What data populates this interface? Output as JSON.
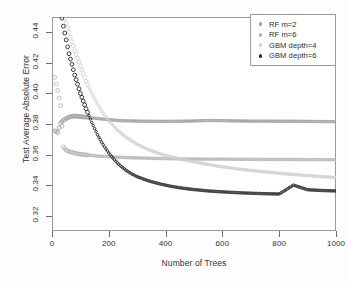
{
  "chart_data": {
    "type": "scatter",
    "title": "",
    "xlabel": "Number of Trees",
    "ylabel": "Test Average Absolute Error",
    "xlim": [
      0,
      1000
    ],
    "ylim": [
      0.31,
      0.45
    ],
    "xticks": [
      "0",
      "200",
      "400",
      "600",
      "800",
      "1000"
    ],
    "xtick_values": [
      0,
      200,
      400,
      600,
      800,
      1000
    ],
    "yticks": [
      "0.32",
      "0.34",
      "0.36",
      "0.38",
      "0.40",
      "0.42",
      "0.44"
    ],
    "ytick_values": [
      0.32,
      0.34,
      0.36,
      0.38,
      0.4,
      0.42,
      0.44
    ],
    "grid": false,
    "legend_position": "top-right",
    "marker": "open-circle",
    "series": [
      {
        "name": "RF m=2",
        "color": "#9e9e9e",
        "x": [
          10,
          20,
          30,
          40,
          50,
          60,
          70,
          80,
          90,
          100,
          120,
          140,
          160,
          180,
          200,
          240,
          280,
          320,
          360,
          400,
          450,
          500,
          550,
          600,
          650,
          700,
          750,
          800,
          850,
          900,
          950,
          1000
        ],
        "y": [
          0.3755,
          0.3745,
          0.3805,
          0.3825,
          0.3835,
          0.3845,
          0.385,
          0.3852,
          0.385,
          0.3848,
          0.3845,
          0.384,
          0.3836,
          0.3832,
          0.3828,
          0.3822,
          0.382,
          0.3818,
          0.3818,
          0.3817,
          0.3818,
          0.382,
          0.3823,
          0.3822,
          0.382,
          0.3819,
          0.3819,
          0.3818,
          0.3818,
          0.3817,
          0.3816,
          0.3815
        ]
      },
      {
        "name": "RF m=6",
        "color": "#b5b5b5",
        "x": [
          10,
          20,
          30,
          40,
          50,
          60,
          70,
          80,
          90,
          100,
          120,
          140,
          160,
          180,
          200,
          240,
          280,
          320,
          360,
          400,
          450,
          500,
          550,
          600,
          650,
          700,
          750,
          800,
          850,
          900,
          950,
          1000
        ],
        "y": [
          0.4105,
          0.402,
          0.392,
          0.365,
          0.3628,
          0.362,
          0.3615,
          0.361,
          0.3605,
          0.3602,
          0.3598,
          0.3594,
          0.359,
          0.3588,
          0.3586,
          0.3582,
          0.3579,
          0.3577,
          0.3575,
          0.3573,
          0.3572,
          0.3571,
          0.357,
          0.357,
          0.3569,
          0.3569,
          0.3568,
          0.3568,
          0.3568,
          0.3567,
          0.3567,
          0.3566
        ]
      },
      {
        "name": "GBM depth=4",
        "color": "#cfcfcf",
        "x": [
          20,
          40,
          60,
          80,
          100,
          120,
          140,
          160,
          180,
          200,
          220,
          240,
          260,
          280,
          300,
          340,
          380,
          420,
          460,
          500,
          550,
          600,
          650,
          700,
          750,
          800,
          850,
          900,
          950,
          1000
        ],
        "y": [
          0.47,
          0.452,
          0.44,
          0.428,
          0.418,
          0.408,
          0.4,
          0.393,
          0.387,
          0.382,
          0.378,
          0.3745,
          0.3715,
          0.369,
          0.3668,
          0.3632,
          0.3605,
          0.3585,
          0.3568,
          0.3552,
          0.3535,
          0.352,
          0.3507,
          0.3496,
          0.3487,
          0.3478,
          0.347,
          0.3463,
          0.3456,
          0.345
        ]
      },
      {
        "name": "GBM depth=6",
        "color": "#303030",
        "x": [
          20,
          40,
          60,
          80,
          100,
          120,
          140,
          160,
          180,
          200,
          220,
          240,
          260,
          280,
          300,
          340,
          380,
          420,
          460,
          500,
          550,
          600,
          650,
          700,
          750,
          800,
          850,
          900,
          950,
          1000
        ],
        "y": [
          0.465,
          0.444,
          0.426,
          0.412,
          0.4,
          0.39,
          0.381,
          0.373,
          0.3665,
          0.361,
          0.3565,
          0.3528,
          0.3498,
          0.3474,
          0.3455,
          0.3428,
          0.3408,
          0.3392,
          0.338,
          0.3371,
          0.3362,
          0.3356,
          0.3351,
          0.3347,
          0.3344,
          0.3342,
          0.34,
          0.337,
          0.3365,
          0.3362
        ]
      }
    ]
  },
  "legend": {
    "items": [
      {
        "label": "RF m=2",
        "color": "#9e9e9e"
      },
      {
        "label": "RF m=6",
        "color": "#b5b5b5"
      },
      {
        "label": "GBM depth=4",
        "color": "#cfcfcf"
      },
      {
        "label": "GBM depth=6",
        "color": "#303030"
      }
    ]
  }
}
